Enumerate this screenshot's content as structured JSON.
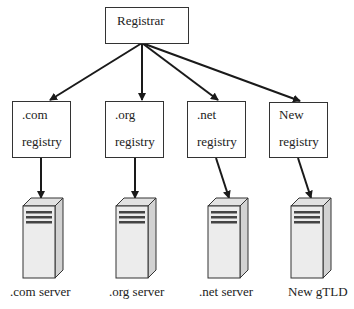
{
  "root": {
    "label": "Registrar"
  },
  "registries": [
    {
      "line1": ".com",
      "line2": "registry",
      "server_label": ".com server"
    },
    {
      "line1": ".org",
      "line2": "registry",
      "server_label": ".org server"
    },
    {
      "line1": ".net",
      "line2": "registry",
      "server_label": ".net server"
    },
    {
      "line1": "New",
      "line2": "registry",
      "server_label": "New gTLD"
    }
  ],
  "icons": {
    "server": "server-tower-icon"
  },
  "colors": {
    "stroke": "#222222",
    "server_front": "#ececec",
    "server_side": "#d6d6d6",
    "server_top": "#e2e2e2",
    "server_slot": "#444444"
  }
}
